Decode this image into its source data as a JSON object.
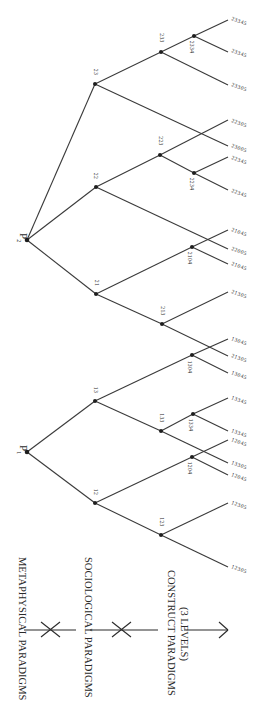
{
  "figure": {
    "orientation": "rotated-90-clockwise",
    "axis": {
      "levels": [
        {
          "label": "METAPHYSICAL PARADIGMS"
        },
        {
          "label": "SOCIOLOGICAL PARADIGMS"
        },
        {
          "label": "CONSTRUCT PARADIGMS",
          "sublabel": "(3 LEVELS)"
        }
      ]
    },
    "roots": [
      {
        "id": "P2",
        "label": "P",
        "subscript": "2"
      },
      {
        "id": "P1",
        "label": "P",
        "subscript": "1"
      }
    ],
    "nodes": {
      "n23": "23",
      "n233": "233",
      "n2334": "2334",
      "n22": "22",
      "n223": "223",
      "n2234": "2234",
      "n21": "21",
      "n213": "213",
      "n2104": "2104",
      "n13": "13",
      "n133": "133",
      "n1334": "1334",
      "n1304": "1304",
      "n12": "12",
      "n123": "123",
      "n1204": "1204"
    },
    "leaves": [
      "23345",
      "23345",
      "23305",
      "22305",
      "23005",
      "22345",
      "22345",
      "21045",
      "22005",
      "21045",
      "21305",
      "13045",
      "21305",
      "13045",
      "13345",
      "13345",
      "12045",
      "13305",
      "12045",
      "12305",
      "12305"
    ]
  }
}
